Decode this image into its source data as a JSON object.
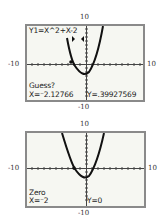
{
  "screens": [
    {
      "id": "guess",
      "equation": "Y1=X^2+X-2",
      "prompt": "Guess?",
      "x_readout": "X=⁻2.12766",
      "y_readout": "Y=.39927569",
      "axis_labels": {
        "top": "10",
        "bottom": "-10",
        "left": "-10",
        "right": "10"
      }
    },
    {
      "id": "zero",
      "prompt": "Zero",
      "x_readout": "X=⁻2",
      "y_readout": "Y=0",
      "axis_labels": {
        "top": "10",
        "bottom": "-10",
        "left": "-10",
        "right": "10"
      }
    }
  ],
  "window": {
    "xmin": -10,
    "xmax": 10,
    "ymin": -10,
    "ymax": 10
  },
  "function": "X^2+X-2",
  "colors": {
    "frame": "#8a8a8a",
    "lcd": "#f6f7f2",
    "ink": "#222222"
  }
}
